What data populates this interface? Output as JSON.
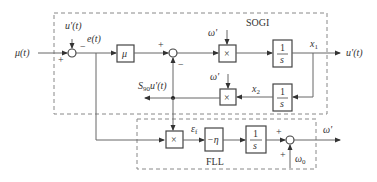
{
  "diagram": {
    "groups": {
      "sogi": {
        "label": "SOGI"
      },
      "fll": {
        "label": "FLL"
      }
    },
    "signals": {
      "input": "μ(t)",
      "feedback_top": "u'(t)",
      "error": "e(t)",
      "x1": "x",
      "x1_sub": "1",
      "x2": "x",
      "x2_sub": "2",
      "output": "u'(t)",
      "quad_prefix": "S",
      "quad_sub": "90",
      "quad_suffix": "u'(t)",
      "omega_in1": "ω'",
      "omega_in2": "ω'",
      "ef": "ε",
      "ef_sub": "f",
      "omega_out": "ω'",
      "omega0": "ω",
      "omega0_sub": "0"
    },
    "blocks": {
      "gain_mu": "μ",
      "mult1": "×",
      "mult2": "×",
      "mult_fll": "×",
      "integrator_num": "1",
      "integrator_den": "s",
      "neg_eta": "−η"
    },
    "signs": {
      "sum1_plus": "+",
      "sum1_minus": "−",
      "sum2_plus": "+",
      "sum2_minus": "−",
      "sum3_plus_left": "+",
      "sum3_plus_bottom": "+"
    }
  }
}
